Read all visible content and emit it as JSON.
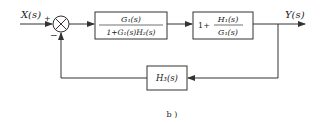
{
  "diagram": {
    "type": "block-diagram",
    "input_label": "X(s)",
    "output_label": "Y(s)",
    "summing_junction": {
      "plus_sign": "+",
      "minus_sign": "−"
    },
    "blocks": [
      {
        "id": "forward-block-1",
        "numerator": "G₁(s)",
        "denominator": "1+G₁(s)H₂(s)"
      },
      {
        "id": "forward-block-2",
        "prefix": "1+",
        "numerator": "H₁(s)",
        "denominator": "G₁(s)"
      },
      {
        "id": "feedback-block",
        "label": "H₃(s)"
      }
    ],
    "caption": "b )"
  }
}
